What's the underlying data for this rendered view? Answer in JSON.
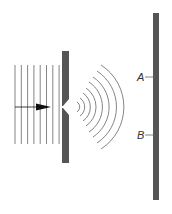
{
  "diagram": {
    "colors": {
      "background": "#ffffff",
      "barrier": "#555555",
      "wave_lines": "#666666",
      "arrow": "#111111",
      "label": "#333333"
    },
    "incident_waves": {
      "count": 8,
      "x_start": 15,
      "spacing": 6.3,
      "y_top": 65,
      "y_bottom": 144
    },
    "barrier": {
      "x": 62,
      "width": 7,
      "y_top": 51,
      "y_bottom": 163,
      "slit_y": 107
    },
    "diffracted_waves": {
      "count": 8,
      "center_x": 68,
      "center_y": 107
    },
    "screen": {
      "x": 153,
      "width": 6,
      "y_top": 13,
      "y_bottom": 200
    },
    "labels": [
      {
        "text": "A",
        "y": 77
      },
      {
        "text": "B",
        "y": 135
      }
    ]
  }
}
